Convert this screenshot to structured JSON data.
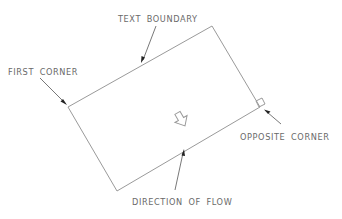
{
  "diagram": {
    "title": "",
    "labels": {
      "text_boundary": "TEXT BOUNDARY",
      "first_corner": "FIRST CORNER",
      "opposite_corner": "OPPOSITE CORNER",
      "direction_of_flow": "DIRECTION OF FLOW"
    },
    "boundary_rectangle": {
      "corners": [
        [
          212,
          26
        ],
        [
          260,
          107
        ],
        [
          117,
          191
        ],
        [
          68,
          107
        ]
      ],
      "rotated": true
    },
    "icons": [
      "flow-direction-arrow-icon",
      "opposite-corner-square-marker-icon"
    ],
    "colors": {
      "line": "#9a9a9a",
      "text": "#6a6a6a",
      "leader": "#555555",
      "arrowhead": "#222222",
      "background": "#ffffff"
    }
  }
}
